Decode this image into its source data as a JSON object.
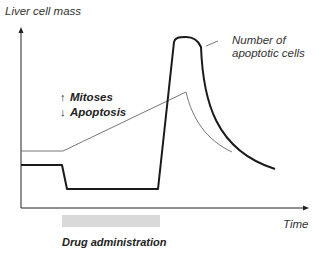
{
  "diagram": {
    "y_axis_label": "Liver cell mass",
    "x_axis_label": "Time",
    "legend": {
      "mitoses_label": "Mitoses",
      "mitoses_arrow": "↑",
      "apoptosis_label": "Apoptosis",
      "apoptosis_arrow": "↓"
    },
    "annotation": {
      "line1": "Number of",
      "line2": "apoptotic cells"
    },
    "drug_bar_label": "Drug administration",
    "colors": {
      "axis": "#222222",
      "thin_curve": "#777777",
      "thick_curve": "#1a1a1a",
      "drug_bar": "#d9d9d9",
      "text": "#333333"
    }
  }
}
